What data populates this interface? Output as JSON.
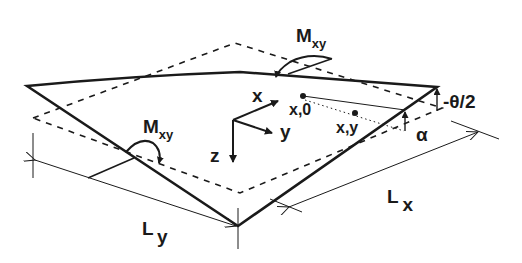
{
  "figure": {
    "colors": {
      "ink": "#1a1a1a",
      "background": "#ffffff"
    }
  },
  "labels": {
    "moment_top": {
      "main": "M",
      "sub": "xy"
    },
    "moment_left": {
      "main": "M",
      "sub": "xy"
    },
    "axis_x": "x",
    "axis_y": "y",
    "axis_z": "z",
    "point_x0": "x,0",
    "point_xy": "x,y",
    "rotation_corner": "-θ/2",
    "angle_alpha": "α",
    "dim_lx": {
      "main": "L",
      "sub": "x"
    },
    "dim_ly": {
      "main": "L",
      "sub": "y"
    }
  }
}
